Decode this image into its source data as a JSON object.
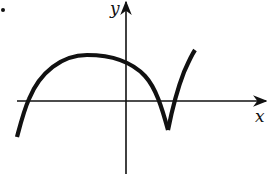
{
  "figure": {
    "type": "function-graph-sketch",
    "axes": {
      "x_label": "x",
      "y_label": "y",
      "origin_px": [
        126,
        101
      ]
    },
    "colors": {
      "ink": "#111111",
      "background": "#ffffff"
    },
    "curve": {
      "description": "Smooth arch crossing x-axis on the left, peak left of y-axis, descending to a sharp cusp below x-axis right of y-axis, then rising steeply",
      "features": {
        "left_x_intercept_px": [
          28,
          101
        ],
        "peak_px": [
          87,
          55
        ],
        "y_intercept_px": [
          126,
          64
        ],
        "right_x_intercept_before_cusp_px": [
          160,
          101
        ],
        "cusp_px": [
          168,
          130
        ],
        "x_intercept_after_cusp_px": [
          176,
          101
        ],
        "end_px": [
          195,
          50
        ],
        "start_px": [
          17,
          137
        ]
      }
    },
    "bullet_marker": true
  }
}
